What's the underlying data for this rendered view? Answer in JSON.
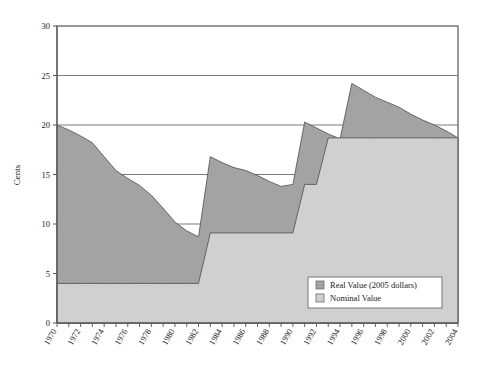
{
  "chart_data": {
    "type": "area",
    "title": "",
    "xlabel": "",
    "ylabel": "Cents",
    "xlim": [
      1970,
      2004
    ],
    "ylim": [
      0,
      30
    ],
    "yticks": [
      0,
      5,
      10,
      15,
      20,
      25,
      30
    ],
    "ytick_labels": [
      "0",
      "5",
      "10",
      "15",
      "20",
      "25",
      "30"
    ],
    "gridlines": [
      5,
      10,
      15,
      20,
      25
    ],
    "grid": true,
    "legend_position": "bottom-right",
    "stacking": "overlay",
    "x": [
      1970,
      1971,
      1972,
      1973,
      1974,
      1975,
      1976,
      1977,
      1978,
      1979,
      1980,
      1981,
      1982,
      1983,
      1984,
      1985,
      1986,
      1987,
      1988,
      1989,
      1990,
      1991,
      1992,
      1993,
      1994,
      1995,
      1996,
      1997,
      1998,
      1999,
      2000,
      2001,
      2002,
      2003,
      2004
    ],
    "xtick_labels": [
      "1970",
      "1972",
      "1974",
      "1976",
      "1978",
      "1980",
      "1982",
      "1984",
      "1986",
      "1988",
      "1990",
      "1992",
      "1994",
      "1996",
      "1998",
      "2000",
      "2002",
      "2004"
    ],
    "series": [
      {
        "name": "Real Value (2005 dollars)",
        "color": "#a3a3a3",
        "values": [
          20.0,
          19.5,
          18.9,
          18.2,
          16.8,
          15.4,
          14.6,
          13.9,
          12.9,
          11.6,
          10.2,
          9.3,
          8.7,
          16.8,
          16.2,
          15.7,
          15.4,
          14.9,
          14.3,
          13.8,
          14.0,
          20.3,
          19.7,
          19.1,
          18.6,
          24.2,
          23.5,
          22.8,
          22.3,
          21.8,
          21.1,
          20.5,
          20.0,
          19.4,
          18.7
        ]
      },
      {
        "name": "Nominal Value",
        "color": "#d0d0d0",
        "values": [
          4.0,
          4.0,
          4.0,
          4.0,
          4.0,
          4.0,
          4.0,
          4.0,
          4.0,
          4.0,
          4.0,
          4.0,
          4.0,
          9.1,
          9.1,
          9.1,
          9.1,
          9.1,
          9.1,
          9.1,
          9.1,
          14.0,
          14.0,
          18.7,
          18.7,
          18.7,
          18.7,
          18.7,
          18.7,
          18.7,
          18.7,
          18.7,
          18.7,
          18.7,
          18.7
        ]
      }
    ]
  },
  "legend": {
    "items": [
      {
        "label": "Real Value (2005 dollars)",
        "swatch": "#a3a3a3"
      },
      {
        "label": "Nominal Value",
        "swatch": "#d0d0d0"
      }
    ]
  },
  "colors": {
    "real_fill": "#a3a3a3",
    "nominal_fill": "#d0d0d0",
    "axis": "#555555",
    "grid": "#6b6b6b",
    "text": "#1a1a1a",
    "background": "#ffffff"
  }
}
